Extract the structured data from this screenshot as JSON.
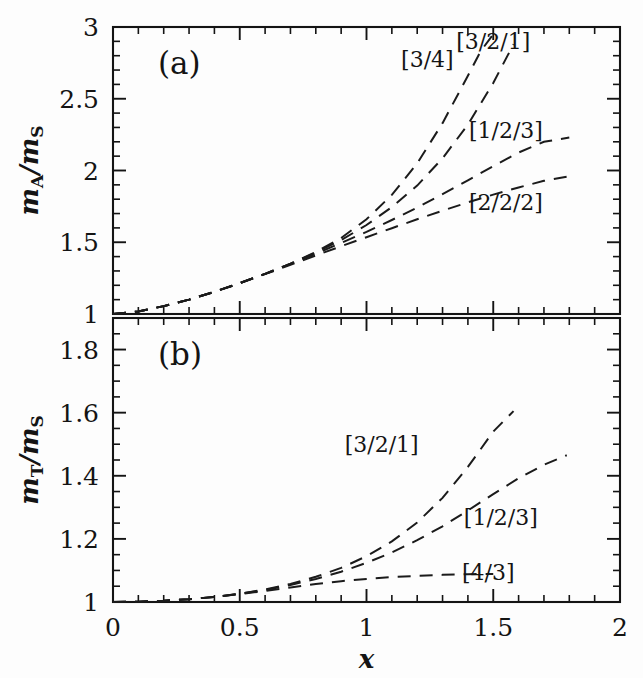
{
  "figure": {
    "panels": [
      {
        "id": "a",
        "letter": "(a)",
        "ylabel": "m_A/m_S",
        "ylabel_parts": {
          "num_var": "m",
          "num_sub": "A",
          "slash": "/",
          "den_var": "m",
          "den_sub": "S"
        }
      },
      {
        "id": "b",
        "letter": "(b)",
        "ylabel": "m_T/m_S",
        "ylabel_parts": {
          "num_var": "m",
          "num_sub": "T",
          "slash": "/",
          "den_var": "m",
          "den_sub": "S"
        }
      }
    ],
    "xlabel": "x",
    "colors": {
      "ink": "#141414",
      "background": "#fdfdfd",
      "curve": "#1b1b1b"
    }
  },
  "chart_data": [
    {
      "type": "line",
      "panel": "a",
      "title": "(a)",
      "xlabel": "x",
      "ylabel": "m_A/m_S",
      "xlim": [
        0,
        2
      ],
      "ylim": [
        1,
        3
      ],
      "xticks": [
        0,
        0.5,
        1,
        1.5,
        2
      ],
      "xticklabels": [
        "0",
        "0.5",
        "1",
        "1.5",
        "2"
      ],
      "yticks": [
        1,
        1.5,
        2,
        2.5,
        3
      ],
      "yticklabels": [
        "1",
        "1.5",
        "2",
        "2.5",
        "3"
      ],
      "xminor_step": 0.1,
      "yminor_step": 0.1,
      "grid": false,
      "legend": "inline-annotations",
      "linestyle": "dashed",
      "series": [
        {
          "name": "[3/4]",
          "label": "[3/4]",
          "label_x": 1.24,
          "label_y": 2.78,
          "x": [
            0.0,
            0.1,
            0.2,
            0.3,
            0.4,
            0.5,
            0.6,
            0.7,
            0.8,
            0.9,
            1.0,
            1.1,
            1.2,
            1.3,
            1.4,
            1.45,
            1.5
          ],
          "y": [
            1.0,
            1.018,
            1.055,
            1.1,
            1.155,
            1.215,
            1.28,
            1.35,
            1.432,
            1.53,
            1.66,
            1.83,
            2.05,
            2.33,
            2.66,
            2.83,
            2.95
          ]
        },
        {
          "name": "[3/2/1]",
          "label": "[3/2/1]",
          "label_x": 1.5,
          "label_y": 2.9,
          "x": [
            0.0,
            0.1,
            0.2,
            0.3,
            0.4,
            0.5,
            0.6,
            0.7,
            0.8,
            0.9,
            1.0,
            1.1,
            1.2,
            1.3,
            1.4,
            1.5,
            1.58
          ],
          "y": [
            1.0,
            1.018,
            1.055,
            1.1,
            1.155,
            1.215,
            1.28,
            1.35,
            1.428,
            1.515,
            1.62,
            1.745,
            1.895,
            2.085,
            2.32,
            2.61,
            2.88
          ]
        },
        {
          "name": "[1/2/3]",
          "label": "[1/2/3]",
          "label_x": 1.55,
          "label_y": 2.28,
          "x": [
            0.0,
            0.1,
            0.2,
            0.3,
            0.4,
            0.5,
            0.6,
            0.7,
            0.8,
            0.9,
            1.0,
            1.1,
            1.2,
            1.3,
            1.4,
            1.5,
            1.6,
            1.7,
            1.8
          ],
          "y": [
            1.0,
            1.018,
            1.055,
            1.1,
            1.155,
            1.215,
            1.28,
            1.348,
            1.42,
            1.495,
            1.572,
            1.655,
            1.742,
            1.835,
            1.932,
            2.03,
            2.125,
            2.2,
            2.23
          ]
        },
        {
          "name": "[2/2/2]",
          "label": "[2/2/2]",
          "label_x": 1.55,
          "label_y": 1.78,
          "x": [
            0.0,
            0.1,
            0.2,
            0.3,
            0.4,
            0.5,
            0.6,
            0.7,
            0.8,
            0.9,
            1.0,
            1.1,
            1.2,
            1.3,
            1.4,
            1.5,
            1.6,
            1.7,
            1.8
          ],
          "y": [
            1.0,
            1.018,
            1.055,
            1.1,
            1.155,
            1.215,
            1.278,
            1.342,
            1.408,
            1.472,
            1.535,
            1.598,
            1.66,
            1.72,
            1.778,
            1.832,
            1.882,
            1.928,
            1.96
          ]
        }
      ]
    },
    {
      "type": "line",
      "panel": "b",
      "title": "(b)",
      "xlabel": "x",
      "ylabel": "m_T/m_S",
      "xlim": [
        0,
        2
      ],
      "ylim": [
        1,
        1.9
      ],
      "xticks": [
        0,
        0.5,
        1,
        1.5,
        2
      ],
      "xticklabels": [
        "0",
        "0.5",
        "1",
        "1.5",
        "2"
      ],
      "yticks": [
        1,
        1.2,
        1.4,
        1.6,
        1.8
      ],
      "yticklabels": [
        "1",
        "1.2",
        "1.4",
        "1.6",
        "1.8"
      ],
      "xminor_step": 0.1,
      "yminor_step": 0.05,
      "grid": false,
      "legend": "inline-annotations",
      "linestyle": "dashed",
      "series": [
        {
          "name": "[3/2/1]",
          "label": "[3/2/1]",
          "label_x": 1.06,
          "label_y": 1.5,
          "x": [
            0.0,
            0.1,
            0.2,
            0.3,
            0.4,
            0.5,
            0.6,
            0.7,
            0.8,
            0.9,
            1.0,
            1.1,
            1.2,
            1.3,
            1.4,
            1.5,
            1.58
          ],
          "y": [
            1.0,
            1.001,
            1.004,
            1.009,
            1.016,
            1.026,
            1.04,
            1.057,
            1.08,
            1.108,
            1.145,
            1.192,
            1.252,
            1.33,
            1.428,
            1.54,
            1.605
          ]
        },
        {
          "name": "[1/2/3]",
          "label": "[1/2/3]",
          "label_x": 1.53,
          "label_y": 1.27,
          "x": [
            0.0,
            0.1,
            0.2,
            0.3,
            0.4,
            0.5,
            0.6,
            0.7,
            0.8,
            0.9,
            1.0,
            1.1,
            1.2,
            1.3,
            1.4,
            1.5,
            1.6,
            1.7,
            1.79
          ],
          "y": [
            1.0,
            1.001,
            1.004,
            1.009,
            1.016,
            1.026,
            1.038,
            1.054,
            1.073,
            1.096,
            1.124,
            1.157,
            1.196,
            1.24,
            1.29,
            1.342,
            1.392,
            1.435,
            1.465
          ]
        },
        {
          "name": "[4/3]",
          "label": "[4/3]",
          "label_x": 1.48,
          "label_y": 1.095,
          "x": [
            0.0,
            0.1,
            0.2,
            0.3,
            0.4,
            0.5,
            0.6,
            0.7,
            0.8,
            0.9,
            1.0,
            1.1,
            1.2,
            1.3,
            1.4,
            1.5
          ],
          "y": [
            1.0,
            1.001,
            1.004,
            1.009,
            1.016,
            1.025,
            1.035,
            1.046,
            1.057,
            1.066,
            1.073,
            1.079,
            1.083,
            1.086,
            1.088,
            1.089
          ]
        }
      ]
    }
  ]
}
